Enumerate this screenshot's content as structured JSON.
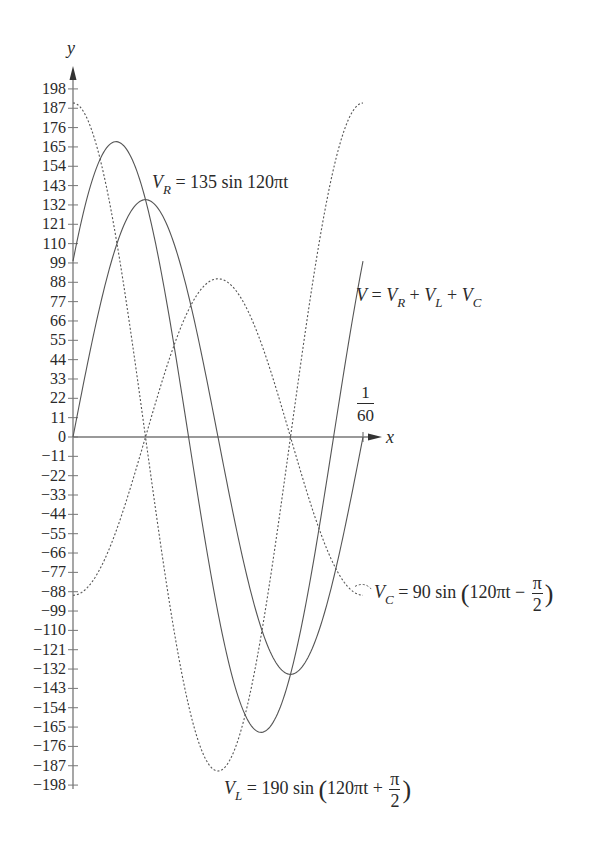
{
  "chart_data": {
    "type": "line",
    "title": "",
    "xlabel": "x",
    "ylabel": "y",
    "x_tick_label": "1/60",
    "x_range": [
      0,
      0.016667
    ],
    "ylim": [
      -198,
      198
    ],
    "y_ticks": [
      198,
      187,
      176,
      165,
      154,
      143,
      132,
      121,
      110,
      99,
      88,
      77,
      66,
      55,
      44,
      33,
      22,
      11,
      0,
      -11,
      -22,
      -33,
      -44,
      -55,
      -66,
      -77,
      -88,
      -99,
      -110,
      -121,
      -132,
      -143,
      -154,
      -165,
      -176,
      -187,
      -198
    ],
    "y_tick_labels": [
      "198",
      "187",
      "176",
      "165",
      "154",
      "143",
      "132",
      "121",
      "110",
      "99",
      "88",
      "77",
      "66",
      "55",
      "44",
      "33",
      "22",
      "11",
      "0",
      "−11",
      "−22",
      "−33",
      "−44",
      "−55",
      "−66",
      "−77",
      "−88",
      "−99",
      "−110",
      "−121",
      "−132",
      "−143",
      "−154",
      "−165",
      "−176",
      "−187",
      "−198"
    ],
    "grid": false,
    "series": [
      {
        "name": "V_R = 135 sin 120πt",
        "amplitude": 135,
        "phase": 0,
        "style": "solid"
      },
      {
        "name": "V_L = 190 sin(120πt + π/2)",
        "amplitude": 190,
        "phase": 1.5708,
        "style": "dotted"
      },
      {
        "name": "V_C = 90 sin(120πt − π/2)",
        "amplitude": 90,
        "phase": -1.5708,
        "style": "dotted"
      },
      {
        "name": "V = V_R + V_L + V_C",
        "amplitude": 168,
        "phase": 0.6375,
        "style": "solid"
      }
    ],
    "sample_points": {
      "t": [
        0,
        0.004167,
        0.008333,
        0.0125,
        0.016667
      ],
      "V_R": [
        0,
        135,
        0,
        -135,
        0
      ],
      "V_L": [
        190,
        0,
        -190,
        0,
        190
      ],
      "V_C": [
        -90,
        0,
        90,
        0,
        -90
      ],
      "V": [
        100,
        135,
        -100,
        -135,
        100
      ]
    }
  },
  "labels": {
    "y_axis": "y",
    "x_axis": "x",
    "period_num": "1",
    "period_den": "60",
    "vr": {
      "sym": "V",
      "sub": "R",
      "rhs": "= 135 sin 120πt"
    },
    "v": {
      "sym": "V",
      "eq": "=",
      "t1": "V",
      "s1": "R",
      "plus1": "+",
      "t2": "V",
      "s2": "L",
      "plus2": "+",
      "t3": "V",
      "s3": "C"
    },
    "vc": {
      "sym": "V",
      "sub": "C",
      "rhs": "= 90 sin",
      "inner": "120πt −",
      "num": "π",
      "den": "2"
    },
    "vl": {
      "sym": "V",
      "sub": "L",
      "rhs": "= 190 sin",
      "inner": "120πt +",
      "num": "π",
      "den": "2"
    }
  },
  "colors": {
    "curve": "#555555",
    "axis": "#777777",
    "text": "#2a2a2a"
  }
}
